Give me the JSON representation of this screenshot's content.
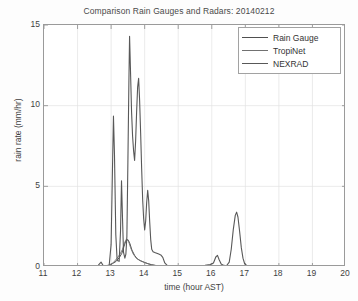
{
  "chart_data": {
    "type": "line",
    "title": "Comparison Rain Gauges and Radars: 20140212",
    "xlabel": "time (hour AST)",
    "ylabel": "rain rate (mm/hr)",
    "xlim": [
      11,
      20
    ],
    "ylim": [
      0,
      15
    ],
    "xticks": [
      11,
      12,
      13,
      14,
      15,
      16,
      17,
      18,
      19,
      20
    ],
    "yticks": [
      0,
      5,
      10,
      15
    ],
    "grid": true,
    "legend_position": "top-right",
    "series": [
      {
        "name": "Rain Gauge",
        "color": "#4f4f4f",
        "width": 1.0,
        "points": [
          [
            11.9,
            0.0
          ],
          [
            12.4,
            0.0
          ],
          [
            12.7,
            0.02
          ],
          [
            12.8,
            0.05
          ],
          [
            12.95,
            0.1
          ],
          [
            13.05,
            0.22
          ],
          [
            13.15,
            0.35
          ],
          [
            13.25,
            0.6
          ],
          [
            13.32,
            0.85
          ],
          [
            13.38,
            1.25
          ],
          [
            13.44,
            1.62
          ],
          [
            13.5,
            1.7
          ],
          [
            13.56,
            1.45
          ],
          [
            13.62,
            1.05
          ],
          [
            13.7,
            0.72
          ],
          [
            13.78,
            0.5
          ],
          [
            13.88,
            0.38
          ],
          [
            14.0,
            0.28
          ],
          [
            14.1,
            0.2
          ],
          [
            14.2,
            0.14
          ],
          [
            14.35,
            0.08
          ],
          [
            14.55,
            0.04
          ],
          [
            14.9,
            0.02
          ],
          [
            15.5,
            0.01
          ],
          [
            16.0,
            0.01
          ],
          [
            16.2,
            0.02
          ],
          [
            16.6,
            0.02
          ],
          [
            17.0,
            0.01
          ],
          [
            18.0,
            0.0
          ],
          [
            19.0,
            0.0
          ],
          [
            20.0,
            0.0
          ]
        ]
      },
      {
        "name": "TropiNet",
        "color": "#717171",
        "width": 0.9,
        "points": [
          [
            11.9,
            0.0
          ],
          [
            12.5,
            0.0
          ],
          [
            12.72,
            0.03
          ],
          [
            12.85,
            0.08
          ],
          [
            12.98,
            0.15
          ],
          [
            13.08,
            0.3
          ],
          [
            13.18,
            0.55
          ],
          [
            13.26,
            0.78
          ],
          [
            13.34,
            1.1
          ],
          [
            13.4,
            1.5
          ],
          [
            13.46,
            1.74
          ],
          [
            13.52,
            1.6
          ],
          [
            13.58,
            1.2
          ],
          [
            13.66,
            0.8
          ],
          [
            13.75,
            0.55
          ],
          [
            13.85,
            0.42
          ],
          [
            13.95,
            0.32
          ],
          [
            14.08,
            0.22
          ],
          [
            14.18,
            0.16
          ],
          [
            14.32,
            0.1
          ],
          [
            14.5,
            0.05
          ],
          [
            14.85,
            0.02
          ],
          [
            15.4,
            0.01
          ],
          [
            16.1,
            0.02
          ],
          [
            16.3,
            0.01
          ],
          [
            16.7,
            0.02
          ],
          [
            17.2,
            0.01
          ],
          [
            18.0,
            0.0
          ],
          [
            19.0,
            0.0
          ],
          [
            20.0,
            0.0
          ]
        ]
      },
      {
        "name": "NEXRAD",
        "color": "#585858",
        "width": 1.1,
        "points": [
          [
            11.9,
            0.0
          ],
          [
            12.3,
            0.0
          ],
          [
            12.58,
            0.02
          ],
          [
            12.7,
            0.3
          ],
          [
            12.76,
            0.1
          ],
          [
            12.84,
            0.05
          ],
          [
            12.94,
            0.04
          ],
          [
            13.0,
            1.4
          ],
          [
            13.04,
            6.0
          ],
          [
            13.07,
            9.35
          ],
          [
            13.1,
            7.0
          ],
          [
            13.14,
            2.0
          ],
          [
            13.18,
            0.4
          ],
          [
            13.24,
            0.35
          ],
          [
            13.28,
            2.2
          ],
          [
            13.31,
            5.35
          ],
          [
            13.34,
            3.0
          ],
          [
            13.37,
            0.9
          ],
          [
            13.41,
            0.55
          ],
          [
            13.44,
            0.8
          ],
          [
            13.47,
            1.9
          ],
          [
            13.5,
            6.5
          ],
          [
            13.53,
            11.5
          ],
          [
            13.55,
            14.3
          ],
          [
            13.58,
            12.0
          ],
          [
            13.61,
            9.6
          ],
          [
            13.64,
            8.1
          ],
          [
            13.67,
            7.2
          ],
          [
            13.7,
            6.6
          ],
          [
            13.73,
            7.8
          ],
          [
            13.76,
            9.6
          ],
          [
            13.79,
            11.15
          ],
          [
            13.82,
            11.7
          ],
          [
            13.85,
            10.3
          ],
          [
            13.88,
            8.3
          ],
          [
            13.91,
            6.1
          ],
          [
            13.94,
            4.2
          ],
          [
            13.97,
            3.0
          ],
          [
            14.0,
            2.3
          ],
          [
            14.03,
            2.85
          ],
          [
            14.06,
            4.0
          ],
          [
            14.09,
            4.75
          ],
          [
            14.12,
            4.1
          ],
          [
            14.15,
            2.8
          ],
          [
            14.18,
            1.7
          ],
          [
            14.21,
            1.1
          ],
          [
            14.25,
            0.95
          ],
          [
            14.3,
            0.9
          ],
          [
            14.36,
            0.85
          ],
          [
            14.42,
            0.8
          ],
          [
            14.48,
            0.75
          ],
          [
            14.54,
            0.6
          ],
          [
            14.6,
            0.25
          ],
          [
            14.68,
            0.08
          ],
          [
            14.8,
            0.04
          ],
          [
            15.0,
            0.03
          ],
          [
            15.3,
            0.03
          ],
          [
            15.6,
            0.05
          ],
          [
            15.8,
            0.1
          ],
          [
            15.95,
            0.15
          ],
          [
            16.05,
            0.25
          ],
          [
            16.12,
            0.62
          ],
          [
            16.17,
            0.72
          ],
          [
            16.22,
            0.45
          ],
          [
            16.28,
            0.18
          ],
          [
            16.36,
            0.1
          ],
          [
            16.44,
            0.08
          ],
          [
            16.52,
            0.3
          ],
          [
            16.58,
            1.1
          ],
          [
            16.64,
            2.3
          ],
          [
            16.7,
            3.2
          ],
          [
            16.74,
            3.4
          ],
          [
            16.78,
            3.1
          ],
          [
            16.83,
            2.2
          ],
          [
            16.88,
            1.2
          ],
          [
            16.93,
            0.55
          ],
          [
            16.98,
            0.2
          ],
          [
            17.05,
            0.08
          ],
          [
            17.2,
            0.04
          ],
          [
            17.6,
            0.02
          ],
          [
            18.0,
            0.02
          ],
          [
            18.5,
            0.01
          ],
          [
            19.0,
            0.01
          ],
          [
            19.5,
            0.01
          ],
          [
            20.0,
            0.0
          ]
        ]
      }
    ]
  },
  "legend": {
    "items": [
      {
        "label": "Rain Gauge"
      },
      {
        "label": "TropiNet"
      },
      {
        "label": "NEXRAD"
      }
    ]
  },
  "axes": {
    "ytick_labels": [
      "15",
      "10",
      "5",
      "0"
    ],
    "xtick_labels": [
      "11",
      "12",
      "13",
      "14",
      "15",
      "16",
      "17",
      "18",
      "19",
      "20"
    ]
  }
}
